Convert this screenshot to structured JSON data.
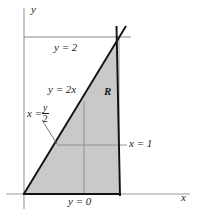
{
  "figure": {
    "name": "region-R-integration-diagram",
    "colors": {
      "shade": "#c9c9c9",
      "boundary": "#111111",
      "guide": "#8a8a8a",
      "axis": "#9a9a9a",
      "text": "#1a1a1a"
    },
    "axes": {
      "y_axis_label": "y",
      "x_axis_label": "x",
      "origin": {
        "x": 24,
        "y": 194
      }
    },
    "labels": {
      "y_equals_2": "y = 2",
      "y_equals_2x": "y = 2x",
      "x_equals_frac_lhs": "x =",
      "x_equals_frac_num": "y",
      "x_equals_frac_den": "2",
      "region": "R",
      "x_equals_1": "x = 1",
      "y_equals_0": "y = 0"
    },
    "geometry": {
      "region_vertices": "(0,0), (1,0), (1,2)",
      "line_y_eq_2x": {
        "from": [
          0,
          0
        ],
        "to": [
          1,
          2
        ]
      },
      "line_x_eq_1": {
        "from": [
          1,
          0
        ],
        "to": [
          1,
          2
        ]
      },
      "line_y_eq_0": {
        "from": [
          0,
          0
        ],
        "to": [
          1,
          0
        ]
      },
      "guide_y_eq_2": {
        "y": 2
      },
      "guide_horizontal_slice": {
        "y": 1
      },
      "guide_vertical_slice": {
        "x": 0.63
      }
    }
  }
}
